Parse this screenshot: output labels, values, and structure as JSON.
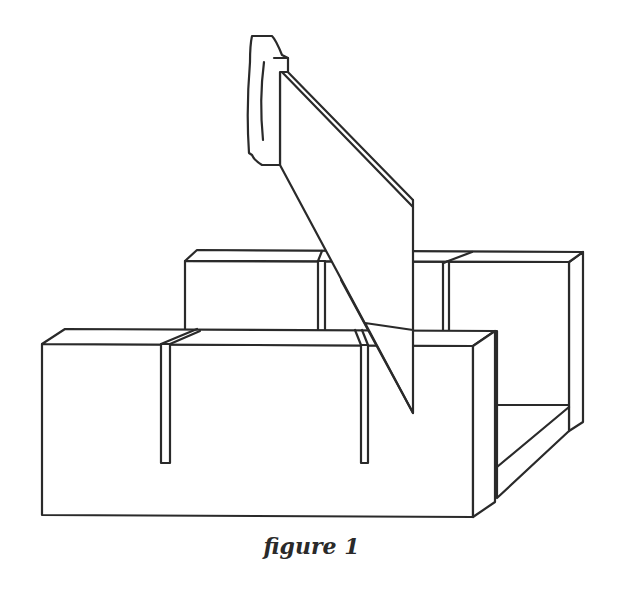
{
  "figure": {
    "caption": "figure 1",
    "parts": [
      "saw-handle",
      "saw-blade",
      "back-wall",
      "front-wall",
      "box-floor",
      "saw-slots"
    ]
  }
}
